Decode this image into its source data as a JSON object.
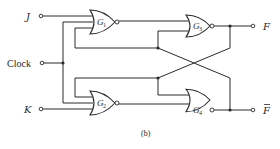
{
  "diagram": {
    "type": "logic-circuit",
    "caption": "(b)",
    "inputs": [
      {
        "id": "J",
        "label": "J"
      },
      {
        "id": "Clock",
        "label": "Clock"
      },
      {
        "id": "K",
        "label": "K"
      }
    ],
    "outputs": [
      {
        "id": "F",
        "label": "F"
      },
      {
        "id": "F_bar",
        "label": "F",
        "overbar": true
      }
    ],
    "gates": [
      {
        "id": "G1",
        "name": "G",
        "sub": "1",
        "kind": "NOR",
        "inputs": [
          "J",
          "Clock",
          "F_bar"
        ]
      },
      {
        "id": "G2",
        "name": "G",
        "sub": "2",
        "kind": "NOR",
        "inputs": [
          "F",
          "Clock",
          "K"
        ]
      },
      {
        "id": "G3",
        "name": "G",
        "sub": "3",
        "kind": "NOR",
        "inputs": [
          "G1",
          "F_bar"
        ],
        "output": "F"
      },
      {
        "id": "G4",
        "name": "G",
        "sub": "4",
        "kind": "NOR",
        "inputs": [
          "F",
          "G2"
        ],
        "output": "F_bar"
      }
    ],
    "colors": {
      "ink": "#2a2a2a",
      "background": "#ffffff"
    }
  }
}
